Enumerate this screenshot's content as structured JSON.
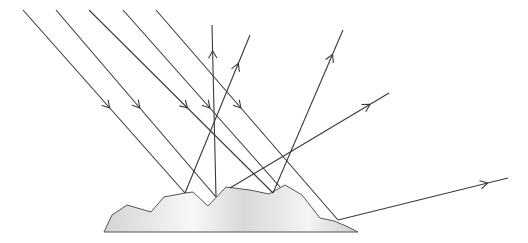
{
  "diagram": {
    "colors": {
      "ray": "#3a3a3a",
      "surface_stroke": "#555555",
      "surface_fill_light": "#f7f7f7",
      "surface_fill_dark": "#cfcfcf"
    },
    "incident_rays": [
      {
        "id": "incident-1",
        "direction": "down-right"
      },
      {
        "id": "incident-2",
        "direction": "down-right"
      },
      {
        "id": "incident-3",
        "direction": "down-right"
      },
      {
        "id": "incident-4",
        "direction": "down-right"
      },
      {
        "id": "incident-5",
        "direction": "down-right"
      }
    ],
    "reflected_rays": [
      {
        "id": "reflected-1",
        "direction": "up-right"
      },
      {
        "id": "reflected-2",
        "direction": "up"
      },
      {
        "id": "reflected-3",
        "direction": "up-right"
      },
      {
        "id": "reflected-4",
        "direction": "up-right"
      },
      {
        "id": "reflected-5",
        "direction": "right"
      }
    ]
  }
}
